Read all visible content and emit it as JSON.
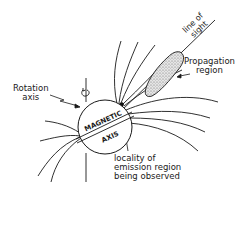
{
  "diagram": {
    "title": "",
    "labels": {
      "rotation_axis": [
        "Rotation",
        "axis"
      ],
      "line_of_sight": [
        "line of",
        "sight"
      ],
      "propagation_region": [
        "Propagation",
        "region"
      ],
      "emission_locality": [
        "locality of",
        "emission region",
        "being observed"
      ],
      "magnetic_axis_top": "MAGNETIC",
      "magnetic_axis_bottom": "AXIS"
    },
    "elements": [
      {
        "id": "star",
        "shape": "circle",
        "label": "MAGNETIC AXIS"
      },
      {
        "id": "rotation-axis",
        "shape": "vertical line with curl arrow",
        "label": "Rotation axis"
      },
      {
        "id": "line-of-sight",
        "shape": "straight line",
        "label": "line of sight"
      },
      {
        "id": "propagation-region",
        "shape": "stippled lens",
        "label": "Propagation region"
      },
      {
        "id": "emission-region",
        "shape": "dark blob",
        "label": "locality of emission region being observed"
      },
      {
        "id": "field-lines",
        "shape": "curved lines",
        "label": ""
      }
    ],
    "colors": {
      "ink": "#1a1a1a",
      "background": "#ffffff",
      "stipple": "#9a9a9a"
    }
  }
}
